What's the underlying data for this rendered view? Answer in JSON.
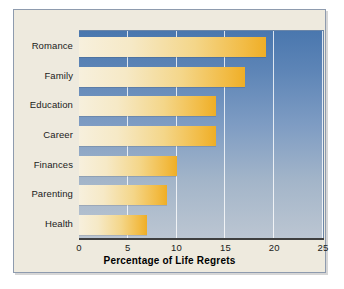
{
  "chart_data": {
    "type": "bar",
    "orientation": "horizontal",
    "title": "",
    "xlabel": "Percentage of Life Regrets",
    "ylabel": "",
    "categories": [
      "Romance",
      "Family",
      "Education",
      "Career",
      "Finances",
      "Parenting",
      "Health"
    ],
    "values": [
      19.2,
      17,
      14,
      14,
      10,
      9,
      7
    ],
    "xlim": [
      0,
      25
    ],
    "xticks": [
      0,
      5,
      10,
      15,
      20,
      25
    ],
    "xtick_labels": [
      "0",
      "5",
      "10",
      "15",
      "20",
      "25"
    ],
    "grid": "vertical-white-gridlines",
    "legend": "none",
    "series": [
      {
        "name": "Percentage of Life Regrets",
        "values": [
          19.2,
          17,
          14,
          14,
          10,
          9,
          7
        ]
      }
    ]
  },
  "colors": {
    "figure_background": "#eeeade",
    "figure_border": "#8e9bae",
    "plot_gradient_top": "#4a77ae",
    "plot_gradient_bottom": "#bcc6d2",
    "bar_gradient_start": "#f7f0dd",
    "bar_gradient_end": "#efae26",
    "gridline": "#ffffff",
    "axis_line": "#3f3f3f",
    "text": "#1a1a1a"
  }
}
